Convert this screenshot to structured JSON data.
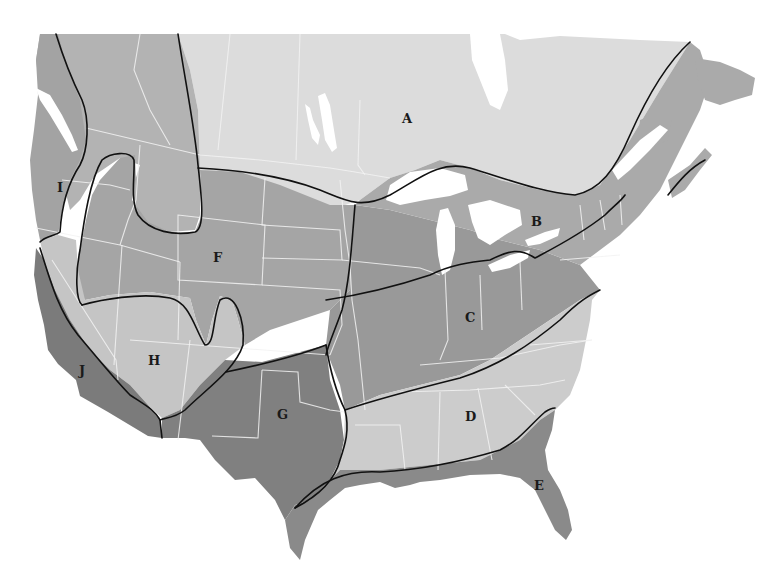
{
  "map": {
    "title": "",
    "type": "regional zone map of North America",
    "colors": {
      "background": "#ffffff",
      "zone_A": "#dcdcdc",
      "zone_B": "#a9a9a9",
      "zone_C": "#999999",
      "zone_D": "#cbcbcb",
      "zone_E": "#8a8a8a",
      "zone_F": "#a4a4a4",
      "zone_G": "#7f7f7f",
      "zone_H": "#c4c4c4",
      "zone_I": "#a0a0a0",
      "zone_J": "#7a7a7a",
      "canada_west": "#b8b8b8",
      "zone_boundary": "#111111",
      "state_border": "#f2f2f2"
    },
    "regions": [
      {
        "id": "A",
        "label": "A"
      },
      {
        "id": "B",
        "label": "B"
      },
      {
        "id": "C",
        "label": "C"
      },
      {
        "id": "D",
        "label": "D"
      },
      {
        "id": "E",
        "label": "E"
      },
      {
        "id": "F",
        "label": "F"
      },
      {
        "id": "G",
        "label": "G"
      },
      {
        "id": "H",
        "label": "H"
      },
      {
        "id": "I",
        "label": "I"
      },
      {
        "id": "J",
        "label": "J"
      }
    ]
  }
}
